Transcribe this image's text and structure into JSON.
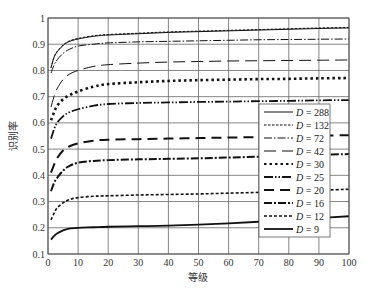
{
  "chart_data": {
    "type": "line",
    "title": "",
    "xlabel": "等级",
    "ylabel": "识别率",
    "xlim": [
      0,
      100
    ],
    "ylim": [
      0.1,
      1.0
    ],
    "xticks": [
      "0",
      "10",
      "20",
      "30",
      "40",
      "50",
      "60",
      "70",
      "80",
      "90",
      "100"
    ],
    "yticks": [
      "0.1",
      "0.2",
      "0.3",
      "0.4",
      "0.5",
      "0.6",
      "0.7",
      "0.8",
      "0.9",
      "1"
    ],
    "grid": true,
    "legend_position": "bottom-right",
    "x": [
      1,
      2,
      3,
      5,
      7,
      10,
      15,
      20,
      30,
      40,
      50,
      60,
      70,
      80,
      90,
      100
    ],
    "series": [
      {
        "name": "D = 288",
        "label_var": "D",
        "label_val": "288",
        "style": "solid",
        "values": [
          0.81,
          0.85,
          0.87,
          0.895,
          0.91,
          0.92,
          0.93,
          0.935,
          0.94,
          0.945,
          0.948,
          0.951,
          0.954,
          0.957,
          0.96,
          0.962
        ]
      },
      {
        "name": "D = 132",
        "label_var": "D",
        "label_val": "132",
        "style": "dashed-fine",
        "values": [
          0.81,
          0.85,
          0.872,
          0.897,
          0.912,
          0.922,
          0.932,
          0.937,
          0.942,
          0.947,
          0.95,
          0.953,
          0.956,
          0.959,
          0.962,
          0.964
        ]
      },
      {
        "name": "D = 72",
        "label_var": "D",
        "label_val": "72",
        "style": "dash-dot",
        "values": [
          0.79,
          0.82,
          0.84,
          0.865,
          0.88,
          0.893,
          0.9,
          0.905,
          0.909,
          0.911,
          0.913,
          0.915,
          0.917,
          0.918,
          0.919,
          0.92
        ]
      },
      {
        "name": "D = 42",
        "label_var": "D",
        "label_val": "42",
        "style": "long-dash",
        "values": [
          0.66,
          0.7,
          0.73,
          0.765,
          0.785,
          0.8,
          0.815,
          0.822,
          0.828,
          0.832,
          0.834,
          0.836,
          0.837,
          0.838,
          0.839,
          0.84
        ]
      },
      {
        "name": "D = 30",
        "label_var": "D",
        "label_val": "30",
        "style": "dotted",
        "values": [
          0.61,
          0.64,
          0.665,
          0.69,
          0.705,
          0.72,
          0.738,
          0.748,
          0.755,
          0.76,
          0.763,
          0.765,
          0.767,
          0.768,
          0.77,
          0.771
        ]
      },
      {
        "name": "D = 25",
        "label_var": "D",
        "label_val": "25",
        "style": "dash-dot-dot",
        "values": [
          0.54,
          0.575,
          0.6,
          0.625,
          0.64,
          0.652,
          0.665,
          0.672,
          0.676,
          0.678,
          0.68,
          0.681,
          0.683,
          0.684,
          0.686,
          0.687
        ]
      },
      {
        "name": "D = 20",
        "label_var": "D",
        "label_val": "20",
        "style": "long-dash-bold",
        "values": [
          0.41,
          0.44,
          0.465,
          0.495,
          0.51,
          0.522,
          0.532,
          0.536,
          0.538,
          0.54,
          0.542,
          0.544,
          0.546,
          0.548,
          0.551,
          0.553
        ]
      },
      {
        "name": "D = 16",
        "label_var": "D",
        "label_val": "16",
        "style": "dash-dot-bold",
        "values": [
          0.34,
          0.37,
          0.39,
          0.418,
          0.435,
          0.448,
          0.455,
          0.458,
          0.461,
          0.463,
          0.465,
          0.468,
          0.471,
          0.474,
          0.478,
          0.481
        ]
      },
      {
        "name": "D = 12",
        "label_var": "D",
        "label_val": "12",
        "style": "short-dash-bold",
        "values": [
          0.23,
          0.255,
          0.275,
          0.295,
          0.307,
          0.315,
          0.32,
          0.322,
          0.325,
          0.327,
          0.329,
          0.332,
          0.335,
          0.339,
          0.343,
          0.347
        ]
      },
      {
        "name": "D = 9",
        "label_var": "D",
        "label_val": "9",
        "style": "solid-bold",
        "values": [
          0.155,
          0.168,
          0.178,
          0.19,
          0.197,
          0.2,
          0.202,
          0.204,
          0.206,
          0.208,
          0.212,
          0.217,
          0.223,
          0.23,
          0.237,
          0.244
        ]
      }
    ]
  }
}
